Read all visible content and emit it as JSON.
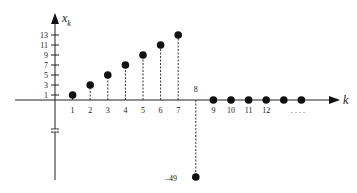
{
  "chart_data": {
    "type": "stem",
    "title": "",
    "xlabel": "k",
    "ylabel": "x_k",
    "y_ticks": [
      1,
      3,
      5,
      7,
      9,
      11,
      13
    ],
    "x_ticks": [
      "1",
      "2",
      "3",
      "4",
      "5",
      "6",
      "7",
      "8",
      "9",
      "10",
      "11",
      "12"
    ],
    "x_ellipsis": ". . . .",
    "points": [
      {
        "k": 1,
        "value": 1
      },
      {
        "k": 2,
        "value": 3
      },
      {
        "k": 3,
        "value": 5
      },
      {
        "k": 4,
        "value": 7
      },
      {
        "k": 5,
        "value": 9
      },
      {
        "k": 6,
        "value": 11
      },
      {
        "k": 7,
        "value": 13
      },
      {
        "k": 8,
        "value": -49
      },
      {
        "k": 9,
        "value": 0
      },
      {
        "k": 10,
        "value": 0
      },
      {
        "k": 11,
        "value": 0
      },
      {
        "k": 12,
        "value": 0
      },
      {
        "k": 13,
        "value": 0
      },
      {
        "k": 14,
        "value": 0
      }
    ],
    "annotations": [
      {
        "text": "-49",
        "at_k": 8
      }
    ],
    "y_axis_break": true,
    "grid": false
  },
  "labels": {
    "y_axis_main": "x",
    "y_axis_sub": "k",
    "x_axis": "k",
    "neg_value": "–49",
    "ellipsis": ". . . ."
  }
}
